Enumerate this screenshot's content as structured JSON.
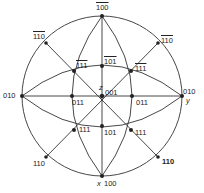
{
  "figure": {
    "type": "stereographic-projection",
    "center": [
      102,
      96
    ],
    "radius": 80,
    "colors": {
      "line": "#333333",
      "pole": "#222222",
      "text": "#222222"
    }
  },
  "poles": [
    {
      "id": "001",
      "label": "001",
      "display": "001",
      "overbars": "",
      "x": 102,
      "y": 96,
      "lx": 106,
      "ly": 90,
      "axis": "z",
      "axlx": 98,
      "axly": 86
    },
    {
      "id": "-100",
      "label": "1̄00",
      "display": "100",
      "overbars": "1",
      "x": 102,
      "y": 16,
      "lx": 98,
      "ly": 4
    },
    {
      "id": "100",
      "label": "100",
      "display": "100",
      "overbars": "",
      "x": 102,
      "y": 180,
      "lx": 104,
      "ly": 182,
      "axis": "x",
      "axlx": 97,
      "axly": 182
    },
    {
      "id": "0-10",
      "label": "01̄0",
      "display": "010",
      "overbars": "1",
      "x": 22,
      "y": 96,
      "lx": 4,
      "ly": 92
    },
    {
      "id": "010",
      "label": "010",
      "display": "010",
      "overbars": "",
      "x": 182,
      "y": 96,
      "lx": 183,
      "ly": 87,
      "axis": "y",
      "axlx": 185,
      "axly": 97
    },
    {
      "id": "-1-10",
      "label": "1̄1̄0",
      "display": "110",
      "overbars": "11",
      "x": 46,
      "y": 43,
      "lx": 33,
      "ly": 33
    },
    {
      "id": "-110",
      "label": "1̄10",
      "display": "110",
      "overbars": "1",
      "x": 158,
      "y": 43,
      "lx": 161,
      "ly": 36
    },
    {
      "id": "1-10",
      "label": "11̄0",
      "display": "110",
      "overbars": "-1",
      "x": 46,
      "y": 157,
      "lx": 33,
      "ly": 160
    },
    {
      "id": "110",
      "label": "110",
      "display": "110",
      "overbars": "",
      "x": 158,
      "y": 157,
      "lx": 162,
      "ly": 158
    },
    {
      "id": "-101",
      "label": "1̄01",
      "display": "101",
      "overbars": "1",
      "x": 102,
      "y": 63,
      "lx": 104,
      "ly": 57
    },
    {
      "id": "101",
      "label": "101",
      "display": "101",
      "overbars": "",
      "x": 102,
      "y": 129,
      "lx": 104,
      "ly": 131
    },
    {
      "id": "0-11",
      "label": "01̄1",
      "display": "011",
      "overbars": "1",
      "x": 71,
      "y": 96,
      "lx": 72,
      "ly": 99
    },
    {
      "id": "011",
      "label": "011",
      "display": "011",
      "overbars": "",
      "x": 133,
      "y": 96,
      "lx": 136,
      "ly": 99
    },
    {
      "id": "-1-11",
      "label": "1̄1̄1",
      "display": "111",
      "overbars": "11",
      "x": 74,
      "y": 71,
      "lx": 77,
      "ly": 61
    },
    {
      "id": "-111",
      "label": "1̄11",
      "display": "111",
      "overbars": "1",
      "x": 133,
      "y": 71,
      "lx": 136,
      "ly": 65
    },
    {
      "id": "1-11",
      "label": "11̄1",
      "display": "111",
      "overbars": "-1",
      "x": 74,
      "y": 126,
      "lx": 79,
      "ly": 125
    },
    {
      "id": "111",
      "label": "111",
      "display": "111",
      "overbars": "",
      "x": 133,
      "y": 126,
      "lx": 136,
      "ly": 128
    }
  ],
  "labels": {
    "p001": "001",
    "pm100": "100",
    "p100": "100",
    "p0m10": "010",
    "p010": "010",
    "pm1m10": "110",
    "pm110": "110",
    "p1m10": "110",
    "p110": "110",
    "pm101": "101",
    "p101": "101",
    "p0m11": "011",
    "p011": "011",
    "pm1m11": "111",
    "pm111": "111",
    "p1m11": "111",
    "p111": "111",
    "axis_x": "x",
    "axis_y": "y",
    "axis_z": "z"
  }
}
